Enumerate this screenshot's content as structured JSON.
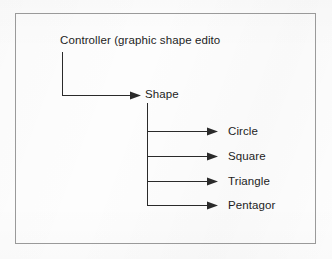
{
  "diagram": {
    "type": "tree",
    "title_visible": false,
    "frame": {
      "border_color": "#9a9a9a",
      "background_color": "#fdfdfd"
    },
    "line_color": "#2a2a2a",
    "text_color": "#1d1d1d",
    "root": {
      "label": "Controller (graphic shape edito",
      "truncated": true
    },
    "parent": {
      "label": "Shape"
    },
    "leaves": [
      {
        "label": "Circle"
      },
      {
        "label": "Square"
      },
      {
        "label": "Triangle"
      },
      {
        "label": "Pentagor"
      }
    ]
  }
}
